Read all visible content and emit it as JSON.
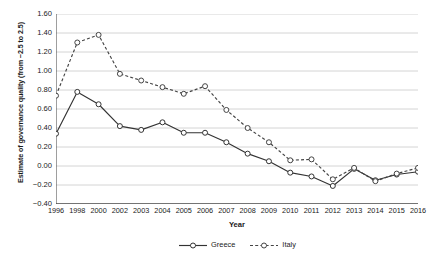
{
  "chart_data": {
    "type": "line",
    "title": "",
    "subtitle": "",
    "xlabel": "Year",
    "ylabel": "Estimate of governance quality (from −2.5 to 2.5)",
    "categories": [
      "1996",
      "1998",
      "2000",
      "2002",
      "2003",
      "2004",
      "2005",
      "2006",
      "2007",
      "2008",
      "2009",
      "2010",
      "2011",
      "2012",
      "2013",
      "2014",
      "2015",
      "2016"
    ],
    "ylim": [
      -0.4,
      1.6
    ],
    "ytick_labels": [
      "1.60",
      "1.40",
      "1.20",
      "1.00",
      "0.80",
      "0.60",
      "0.40",
      "0.20",
      "0.00",
      "-0.20",
      "-0.40"
    ],
    "ytick_values": [
      1.6,
      1.4,
      1.2,
      1.0,
      0.8,
      0.6,
      0.4,
      0.2,
      0.0,
      -0.2,
      -0.4
    ],
    "ytick_step": 0.2,
    "grid": true,
    "grid_axis": "y",
    "legend_position": "bottom-center",
    "series": [
      {
        "name": "Greece",
        "style": "solid",
        "marker": "open-circle",
        "color": "#333333",
        "values": [
          0.34,
          0.78,
          0.65,
          0.42,
          0.38,
          0.46,
          0.35,
          0.35,
          0.25,
          0.13,
          0.05,
          -0.07,
          -0.11,
          -0.21,
          -0.03,
          -0.15,
          -0.09,
          -0.06
        ]
      },
      {
        "name": "Italy",
        "style": "dashed",
        "marker": "open-circle",
        "color": "#444444",
        "values": [
          0.74,
          1.3,
          1.38,
          0.97,
          0.9,
          0.83,
          0.76,
          0.84,
          0.59,
          0.4,
          0.25,
          0.06,
          0.07,
          -0.14,
          -0.02,
          -0.16,
          -0.08,
          -0.02
        ]
      }
    ]
  },
  "colors": {
    "grid": "#c9c9c9",
    "axis": "#4d4d4d",
    "text": "#222222",
    "background": "#ffffff"
  },
  "legend": {
    "items": [
      {
        "label": "Greece"
      },
      {
        "label": "Italy"
      }
    ]
  }
}
